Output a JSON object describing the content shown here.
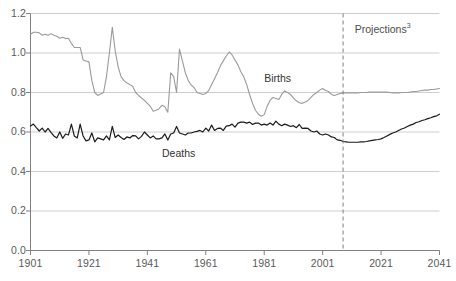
{
  "chart_data": {
    "type": "line",
    "title": "",
    "subtitle": "",
    "xlabel": "",
    "ylabel": "",
    "xlim": [
      1901,
      2041
    ],
    "ylim": [
      0.0,
      1.2
    ],
    "grid": true,
    "legend_position": "inline-annotations",
    "xticks": [
      "1901",
      "1921",
      "1941",
      "1961",
      "1981",
      "2001",
      "2021",
      "2041"
    ],
    "xtick_values": [
      1901,
      1921,
      1941,
      1961,
      1981,
      2001,
      2021,
      2041
    ],
    "yticks": [
      "0.0",
      "0.2",
      "0.4",
      "0.6",
      "0.8",
      "1.0",
      "1.2"
    ],
    "ytick_values": [
      0.0,
      0.2,
      0.4,
      0.6,
      0.8,
      1.0,
      1.2
    ],
    "annotations": [
      {
        "name": "births-label",
        "text": "Births",
        "x": 1981,
        "y": 0.87
      },
      {
        "name": "deaths-label",
        "text": "Deaths",
        "x": 1946,
        "y": 0.49
      },
      {
        "name": "projections-label",
        "text": "Projections",
        "superscript": "3",
        "x": 2012,
        "y": 1.12
      }
    ],
    "projection_divider": {
      "x": 2008,
      "style": "dashed",
      "color": "#808080"
    },
    "series": [
      {
        "name": "Births",
        "color": "#9a9a9a",
        "width": 1.1,
        "x": [
          1901,
          1902,
          1903,
          1904,
          1905,
          1906,
          1907,
          1908,
          1909,
          1910,
          1911,
          1912,
          1913,
          1914,
          1915,
          1916,
          1917,
          1918,
          1919,
          1920,
          1921,
          1922,
          1923,
          1924,
          1925,
          1926,
          1927,
          1928,
          1929,
          1930,
          1931,
          1932,
          1933,
          1934,
          1935,
          1936,
          1937,
          1938,
          1939,
          1940,
          1941,
          1942,
          1943,
          1944,
          1945,
          1946,
          1947,
          1948,
          1949,
          1950,
          1951,
          1952,
          1953,
          1954,
          1955,
          1956,
          1957,
          1958,
          1959,
          1960,
          1961,
          1962,
          1963,
          1964,
          1965,
          1966,
          1967,
          1968,
          1969,
          1970,
          1971,
          1972,
          1973,
          1974,
          1975,
          1976,
          1977,
          1978,
          1979,
          1980,
          1981,
          1982,
          1983,
          1984,
          1985,
          1986,
          1987,
          1988,
          1989,
          1990,
          1991,
          1992,
          1993,
          1994,
          1995,
          1996,
          1997,
          1998,
          1999,
          2000,
          2001,
          2002,
          2003,
          2004,
          2005,
          2006,
          2007,
          2008,
          2009,
          2010,
          2011,
          2012,
          2013,
          2014,
          2015,
          2016,
          2017,
          2018,
          2019,
          2020,
          2021,
          2022,
          2023,
          2024,
          2025,
          2026,
          2027,
          2028,
          2029,
          2030,
          2031,
          2032,
          2033,
          2034,
          2035,
          2036,
          2037,
          2038,
          2039,
          2040,
          2041
        ],
        "y": [
          1.095,
          1.105,
          1.105,
          1.102,
          1.09,
          1.095,
          1.09,
          1.098,
          1.09,
          1.085,
          1.075,
          1.08,
          1.073,
          1.075,
          1.048,
          1.028,
          1.028,
          1.028,
          0.965,
          0.96,
          0.955,
          0.86,
          0.8,
          0.785,
          0.792,
          0.8,
          0.88,
          1.0,
          1.13,
          1.01,
          0.93,
          0.88,
          0.86,
          0.848,
          0.84,
          0.83,
          0.8,
          0.785,
          0.772,
          0.76,
          0.745,
          0.73,
          0.705,
          0.71,
          0.718,
          0.735,
          0.728,
          0.7,
          0.9,
          0.88,
          0.8,
          1.02,
          0.96,
          0.9,
          0.86,
          0.838,
          0.825,
          0.8,
          0.795,
          0.79,
          0.795,
          0.81,
          0.84,
          0.87,
          0.9,
          0.935,
          0.96,
          0.985,
          1.005,
          0.99,
          0.965,
          0.94,
          0.905,
          0.88,
          0.84,
          0.79,
          0.745,
          0.71,
          0.69,
          0.68,
          0.688,
          0.73,
          0.76,
          0.775,
          0.77,
          0.765,
          0.79,
          0.808,
          0.8,
          0.79,
          0.772,
          0.758,
          0.748,
          0.745,
          0.752,
          0.76,
          0.775,
          0.79,
          0.8,
          0.812,
          0.82,
          0.81,
          0.805,
          0.79,
          0.785,
          0.79,
          0.795,
          0.798,
          0.798,
          0.798,
          0.798,
          0.798,
          0.798,
          0.8,
          0.8,
          0.8,
          0.802,
          0.802,
          0.802,
          0.802,
          0.802,
          0.802,
          0.802,
          0.8,
          0.798,
          0.798,
          0.798,
          0.8,
          0.8,
          0.8,
          0.802,
          0.805,
          0.805,
          0.808,
          0.81,
          0.812,
          0.812,
          0.815,
          0.815,
          0.818,
          0.82
        ]
      },
      {
        "name": "Deaths",
        "color": "#1a1a1a",
        "width": 1.2,
        "x": [
          1901,
          1902,
          1903,
          1904,
          1905,
          1906,
          1907,
          1908,
          1909,
          1910,
          1911,
          1912,
          1913,
          1914,
          1915,
          1916,
          1917,
          1918,
          1919,
          1920,
          1921,
          1922,
          1923,
          1924,
          1925,
          1926,
          1927,
          1928,
          1929,
          1930,
          1931,
          1932,
          1933,
          1934,
          1935,
          1936,
          1937,
          1938,
          1939,
          1940,
          1941,
          1942,
          1943,
          1944,
          1945,
          1946,
          1947,
          1948,
          1949,
          1950,
          1951,
          1952,
          1953,
          1954,
          1955,
          1956,
          1957,
          1958,
          1959,
          1960,
          1961,
          1962,
          1963,
          1964,
          1965,
          1966,
          1967,
          1968,
          1969,
          1970,
          1971,
          1972,
          1973,
          1974,
          1975,
          1976,
          1977,
          1978,
          1979,
          1980,
          1981,
          1982,
          1983,
          1984,
          1985,
          1986,
          1987,
          1988,
          1989,
          1990,
          1991,
          1992,
          1993,
          1994,
          1995,
          1996,
          1997,
          1998,
          1999,
          2000,
          2001,
          2002,
          2003,
          2004,
          2005,
          2006,
          2007,
          2008,
          2009,
          2010,
          2011,
          2012,
          2013,
          2014,
          2015,
          2016,
          2017,
          2018,
          2019,
          2020,
          2021,
          2022,
          2023,
          2024,
          2025,
          2026,
          2027,
          2028,
          2029,
          2030,
          2031,
          2032,
          2033,
          2034,
          2035,
          2036,
          2037,
          2038,
          2039,
          2040,
          2041
        ],
        "y": [
          0.63,
          0.64,
          0.622,
          0.605,
          0.62,
          0.6,
          0.618,
          0.598,
          0.58,
          0.57,
          0.6,
          0.568,
          0.59,
          0.585,
          0.64,
          0.58,
          0.57,
          0.64,
          0.58,
          0.555,
          0.56,
          0.595,
          0.55,
          0.57,
          0.565,
          0.56,
          0.58,
          0.56,
          0.628,
          0.572,
          0.585,
          0.572,
          0.562,
          0.575,
          0.57,
          0.582,
          0.58,
          0.565,
          0.578,
          0.6,
          0.585,
          0.57,
          0.58,
          0.565,
          0.565,
          0.57,
          0.59,
          0.56,
          0.59,
          0.595,
          0.628,
          0.595,
          0.59,
          0.585,
          0.595,
          0.595,
          0.6,
          0.603,
          0.608,
          0.6,
          0.62,
          0.605,
          0.635,
          0.608,
          0.618,
          0.62,
          0.608,
          0.63,
          0.632,
          0.64,
          0.625,
          0.645,
          0.65,
          0.65,
          0.645,
          0.65,
          0.638,
          0.645,
          0.645,
          0.635,
          0.64,
          0.635,
          0.645,
          0.635,
          0.655,
          0.64,
          0.632,
          0.64,
          0.635,
          0.628,
          0.632,
          0.622,
          0.638,
          0.618,
          0.62,
          0.618,
          0.605,
          0.6,
          0.605,
          0.59,
          0.585,
          0.59,
          0.585,
          0.575,
          0.572,
          0.56,
          0.558,
          0.552,
          0.55,
          0.548,
          0.548,
          0.548,
          0.548,
          0.55,
          0.55,
          0.552,
          0.555,
          0.558,
          0.56,
          0.562,
          0.565,
          0.572,
          0.58,
          0.588,
          0.595,
          0.6,
          0.608,
          0.615,
          0.62,
          0.628,
          0.635,
          0.64,
          0.648,
          0.652,
          0.658,
          0.662,
          0.668,
          0.672,
          0.678,
          0.682,
          0.69
        ]
      }
    ]
  },
  "axis": {
    "y_tick_labels": [
      "1.2",
      "1.0",
      "0.8",
      "0.6",
      "0.4",
      "0.2",
      "0.0"
    ],
    "x_tick_labels": [
      "1901",
      "1921",
      "1941",
      "1961",
      "1981",
      "2001",
      "2021",
      "2041"
    ]
  },
  "labels": {
    "births": "Births",
    "deaths": "Deaths",
    "projections": "Projections",
    "projections_sup": "3"
  },
  "colors": {
    "births_line": "#9a9a9a",
    "deaths_line": "#1a1a1a",
    "grid": "#c8c8c8",
    "axis": "#808080",
    "divider": "#808080",
    "tick_text": "#595959"
  }
}
